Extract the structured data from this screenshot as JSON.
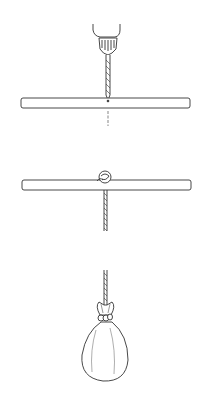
{
  "figure": {
    "type": "instruction-illustration",
    "steps": [
      {
        "id": 1,
        "description": "Drill a hole through the center of the rod",
        "objects": [
          "drill",
          "drill-bit",
          "rod",
          "hole-guide-line"
        ]
      },
      {
        "id": 2,
        "description": "Thread the rope through the hole and tie a knot on top",
        "objects": [
          "rod",
          "knot",
          "rope"
        ]
      },
      {
        "id": 3,
        "description": "Tie the rope to a filled bag",
        "objects": [
          "rope",
          "bag"
        ]
      }
    ],
    "colors": {
      "line": "#333333",
      "fill": "#ffffff",
      "background": "#ffffff"
    }
  }
}
